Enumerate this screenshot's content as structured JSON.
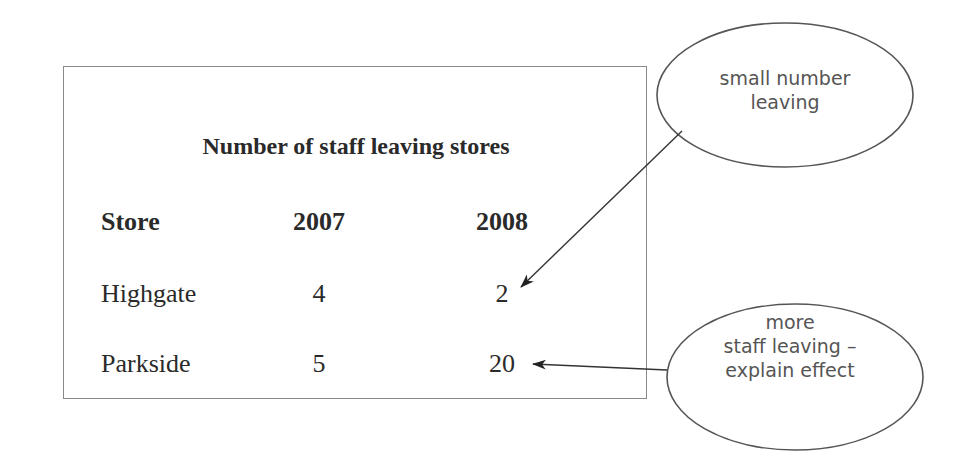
{
  "table": {
    "title": "Number of staff leaving stores",
    "headers": [
      "Store",
      "2007",
      "2008"
    ],
    "rows": [
      [
        "Highgate",
        "4",
        "2"
      ],
      [
        "Parkside",
        "5",
        "20"
      ]
    ]
  },
  "annotations": [
    {
      "lines": [
        "small number",
        "leaving"
      ],
      "points_to": "Highgate 2008"
    },
    {
      "lines": [
        "more",
        "staff leaving –",
        "explain effect"
      ],
      "points_to": "Parkside 2008"
    }
  ],
  "colors": {
    "border": "#8a8a8a",
    "text": "#2a2a2a",
    "annotation": "#555555"
  }
}
